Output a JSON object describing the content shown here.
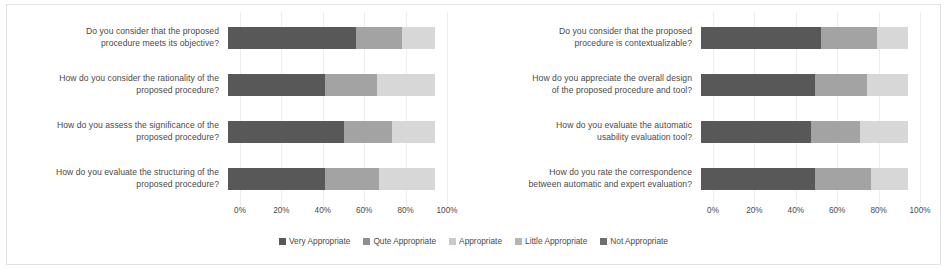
{
  "chart_data": [
    {
      "type": "bar",
      "orientation": "horizontal",
      "stacked": true,
      "percent": true,
      "title": "",
      "xlabel": "",
      "ylabel": "",
      "xlim": [
        0,
        100
      ],
      "xticks": [
        "0%",
        "20%",
        "40%",
        "60%",
        "80%",
        "100%"
      ],
      "xtick_values": [
        0,
        20,
        40,
        60,
        80,
        100
      ],
      "grid": true,
      "legend_position": "bottom",
      "categories": [
        "Do you consider that the proposed procedure meets its objective?",
        "How do you consider the rationality of the proposed procedure?",
        "How do you assess the significance of the proposed procedure?",
        "How do you evaluate the structuring of the proposed procedure?"
      ],
      "series": [
        {
          "name": "Very Appropriate",
          "color": "#585858",
          "values": [
            62,
            47,
            56,
            47
          ]
        },
        {
          "name": "Qute Appropriate",
          "color": "#a3a3a3",
          "values": [
            22,
            25,
            23,
            26
          ]
        },
        {
          "name": "Appropriate",
          "color": "#d2d2d2",
          "values": [
            16,
            28,
            21,
            27
          ]
        },
        {
          "name": "Little Appropriate",
          "color": "#e8e8e8",
          "values": [
            0,
            0,
            0,
            0
          ]
        },
        {
          "name": "Not Appropriate",
          "color": "#6e6e6e",
          "values": [
            0,
            0,
            0,
            0
          ]
        }
      ]
    },
    {
      "type": "bar",
      "orientation": "horizontal",
      "stacked": true,
      "percent": true,
      "title": "",
      "xlabel": "",
      "ylabel": "",
      "xlim": [
        0,
        100
      ],
      "xticks": [
        "0%",
        "20%",
        "40%",
        "60%",
        "80%",
        "100%"
      ],
      "xtick_values": [
        0,
        20,
        40,
        60,
        80,
        100
      ],
      "grid": true,
      "legend_position": "bottom",
      "categories": [
        "Do you consider that the proposed procedure is contextualizable?",
        "How do you appreciate the overall design of the proposed procedure and tool?",
        "How do you evaluate the automatic usability evaluation tool?",
        "How do you rate the correspondence between automatic and expert evaluation?"
      ],
      "series": [
        {
          "name": "Very Appropriate",
          "color": "#585858",
          "values": [
            58,
            55,
            53,
            55
          ]
        },
        {
          "name": "Qute Appropriate",
          "color": "#a3a3a3",
          "values": [
            27,
            25,
            24,
            27
          ]
        },
        {
          "name": "Appropriate",
          "color": "#d2d2d2",
          "values": [
            15,
            20,
            23,
            18
          ]
        },
        {
          "name": "Little Appropriate",
          "color": "#e8e8e8",
          "values": [
            0,
            0,
            0,
            0
          ]
        },
        {
          "name": "Not Appropriate",
          "color": "#6e6e6e",
          "values": [
            0,
            0,
            0,
            0
          ]
        }
      ]
    }
  ],
  "left_chart": {
    "rows": [
      {
        "label_line1": "Do you consider that the proposed",
        "label_line2": "procedure meets its objective?",
        "segments": [
          {
            "label": "Very Appropriate",
            "value": 62,
            "color": "#585858"
          },
          {
            "label": "Qute Appropriate",
            "value": 22,
            "color": "#a3a3a3"
          },
          {
            "label": "Appropriate",
            "value": 16,
            "color": "#d7d7d7"
          }
        ]
      },
      {
        "label_line1": "How do you consider the rationality of the",
        "label_line2": "proposed procedure?",
        "segments": [
          {
            "label": "Very Appropriate",
            "value": 47,
            "color": "#585858"
          },
          {
            "label": "Qute Appropriate",
            "value": 25,
            "color": "#a3a3a3"
          },
          {
            "label": "Appropriate",
            "value": 28,
            "color": "#d7d7d7"
          }
        ]
      },
      {
        "label_line1": "How do you assess the significance of the",
        "label_line2": "proposed procedure?",
        "segments": [
          {
            "label": "Very Appropriate",
            "value": 56,
            "color": "#585858"
          },
          {
            "label": "Qute Appropriate",
            "value": 23,
            "color": "#a3a3a3"
          },
          {
            "label": "Appropriate",
            "value": 21,
            "color": "#d7d7d7"
          }
        ]
      },
      {
        "label_line1": "How do you evaluate the structuring of the",
        "label_line2": "proposed procedure?",
        "segments": [
          {
            "label": "Very Appropriate",
            "value": 47,
            "color": "#585858"
          },
          {
            "label": "Qute Appropriate",
            "value": 26,
            "color": "#a3a3a3"
          },
          {
            "label": "Appropriate",
            "value": 27,
            "color": "#d7d7d7"
          }
        ]
      }
    ],
    "axis_ticks": [
      {
        "label": "0%",
        "pos": 0
      },
      {
        "label": "20%",
        "pos": 20
      },
      {
        "label": "40%",
        "pos": 40
      },
      {
        "label": "60%",
        "pos": 60
      },
      {
        "label": "80%",
        "pos": 80
      },
      {
        "label": "100%",
        "pos": 100
      }
    ]
  },
  "right_chart": {
    "rows": [
      {
        "label_line1": "Do you consider that the proposed",
        "label_line2": "procedure is contextualizable?",
        "segments": [
          {
            "label": "Very Appropriate",
            "value": 58,
            "color": "#585858"
          },
          {
            "label": "Qute Appropriate",
            "value": 27,
            "color": "#a3a3a3"
          },
          {
            "label": "Appropriate",
            "value": 15,
            "color": "#d7d7d7"
          }
        ]
      },
      {
        "label_line1": "How do you appreciate the overall design",
        "label_line2": "of the proposed procedure and tool?",
        "segments": [
          {
            "label": "Very Appropriate",
            "value": 55,
            "color": "#585858"
          },
          {
            "label": "Qute Appropriate",
            "value": 25,
            "color": "#a3a3a3"
          },
          {
            "label": "Appropriate",
            "value": 20,
            "color": "#d7d7d7"
          }
        ]
      },
      {
        "label_line1": "How do you evaluate the automatic",
        "label_line2": "usability evaluation tool?",
        "segments": [
          {
            "label": "Very Appropriate",
            "value": 53,
            "color": "#585858"
          },
          {
            "label": "Qute Appropriate",
            "value": 24,
            "color": "#a3a3a3"
          },
          {
            "label": "Appropriate",
            "value": 23,
            "color": "#d7d7d7"
          }
        ]
      },
      {
        "label_line1": "How do you rate the correspondence",
        "label_line2": "between automatic and expert evaluation?",
        "segments": [
          {
            "label": "Very Appropriate",
            "value": 55,
            "color": "#585858"
          },
          {
            "label": "Qute Appropriate",
            "value": 27,
            "color": "#a3a3a3"
          },
          {
            "label": "Appropriate",
            "value": 18,
            "color": "#d7d7d7"
          }
        ]
      }
    ],
    "axis_ticks": [
      {
        "label": "0%",
        "pos": 0
      },
      {
        "label": "20%",
        "pos": 20
      },
      {
        "label": "40%",
        "pos": 40
      },
      {
        "label": "60%",
        "pos": 60
      },
      {
        "label": "80%",
        "pos": 80
      },
      {
        "label": "100%",
        "pos": 100
      }
    ]
  },
  "legend": {
    "items": [
      {
        "label": "Very Appropriate",
        "color": "#585858"
      },
      {
        "label": "Qute Appropriate",
        "color": "#8f8f8f"
      },
      {
        "label": "Appropriate",
        "color": "#c9c9c9"
      },
      {
        "label": "Little Appropriate",
        "color": "#b5b5b5"
      },
      {
        "label": "Not Appropriate",
        "color": "#6e6e6e"
      }
    ]
  }
}
